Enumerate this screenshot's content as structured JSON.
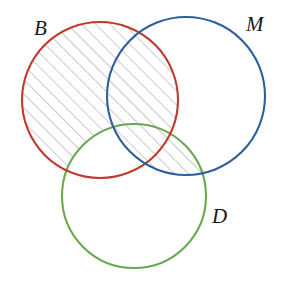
{
  "figure": {
    "width": 285,
    "height": 284,
    "background_color": "#ffffff"
  },
  "sets": [
    {
      "id": "B",
      "label": "B",
      "color": "#c0392b",
      "color_name": "red",
      "cx": 100,
      "cy": 100,
      "r": 78,
      "label_x": 34,
      "label_y": 18,
      "label_position": "upper-left outside"
    },
    {
      "id": "M",
      "label": "M",
      "color": "#2c5f9e",
      "color_name": "blue",
      "cx": 186,
      "cy": 96,
      "r": 79,
      "label_x": 246,
      "label_y": 14,
      "label_position": "upper-right outside"
    },
    {
      "id": "D",
      "label": "D",
      "color": "#6aa84f",
      "color_name": "green",
      "cx": 134,
      "cy": 196,
      "r": 72,
      "label_x": 212,
      "label_y": 206,
      "label_position": "lower-right outside"
    }
  ],
  "shading": {
    "style": "diagonal-hatch",
    "hatch_color": "#8a8a8a",
    "hatch_spacing": 10,
    "hatch_angle_deg": 45,
    "hatch_line_width": 0.9,
    "fill_color": "none",
    "expression": "(B \\ D) ∪ (M ∩ D)",
    "regions": [
      "B only",
      "B ∩ M (above D)",
      "M ∩ D",
      "B ∩ M ∩ D"
    ]
  },
  "stroke": {
    "width": 2.1,
    "fill": "none"
  }
}
